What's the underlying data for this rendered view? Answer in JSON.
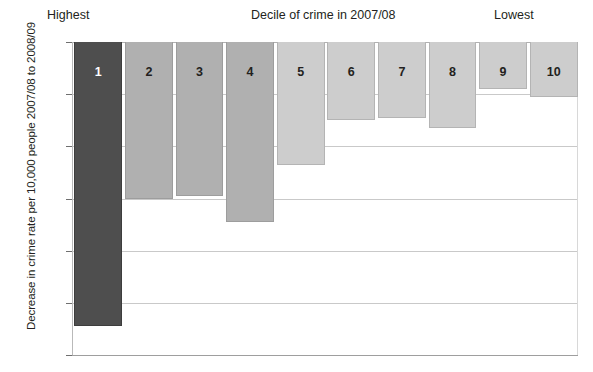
{
  "figure": {
    "top_left_label": "Highest",
    "top_center_label": "Decile of crime in 2007/08",
    "top_right_label": "Lowest",
    "y_axis_title": "Decrease in crime rate per 10,000 people 2007/08 to 2008/09"
  },
  "colors": {
    "bar_dark": "#4e4e4e",
    "bar_mid": "#b0b0b0",
    "bar_light": "#cdcdcd",
    "gridline": "#c9c9c9",
    "text": "#231f20"
  },
  "chart_data": {
    "type": "bar",
    "title": "",
    "subtitle": "",
    "xlabel": "Decile of crime in 2007/08",
    "ylabel": "Decrease in crime rate per 10,000 people 2007/08 to 2008/09",
    "categories": [
      "1",
      "2",
      "3",
      "4",
      "5",
      "6",
      "7",
      "8",
      "9",
      "10"
    ],
    "values": [
      -109,
      -60,
      -59,
      -69,
      -47,
      -30,
      -29,
      -33,
      -18,
      -21
    ],
    "bar_shades": [
      "dark",
      "mid",
      "mid",
      "mid",
      "light",
      "light",
      "light",
      "light",
      "light",
      "light"
    ],
    "ylim": [
      -120,
      0
    ],
    "yticks": [
      0,
      -20,
      -40,
      -60,
      -80,
      -100,
      -120
    ],
    "ytick_labels": [
      "0",
      "−20",
      "−40",
      "−60",
      "−80",
      "−100",
      "−120"
    ],
    "grid": true,
    "grid_axis": "y",
    "legend": false,
    "annotations": [
      {
        "text": "Highest",
        "position": "above-left"
      },
      {
        "text": "Lowest",
        "position": "above-right"
      }
    ]
  }
}
